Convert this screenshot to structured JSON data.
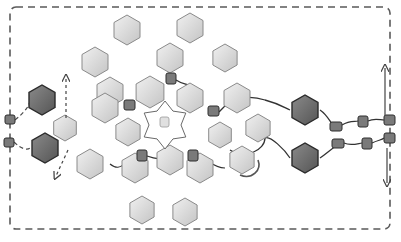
{
  "diagram": {
    "colors": {
      "background": "#ffffff",
      "light_hex_fill": "#d9d9d9",
      "light_hex_stroke": "#8a8a8a",
      "dark_hex_fill": "#6f6f6f",
      "dark_hex_stroke": "#2a2a2a",
      "linker_fill": "#7a7a7a",
      "line": "#4a4a4a",
      "dash": "#5a5a5a"
    },
    "boundary": {
      "x": 10,
      "y": 7,
      "w": 380,
      "h": 222
    },
    "light_hexagons": [
      {
        "cx": 127,
        "cy": 30,
        "r": 15
      },
      {
        "cx": 190,
        "cy": 28,
        "r": 15
      },
      {
        "cx": 95,
        "cy": 62,
        "r": 15
      },
      {
        "cx": 170,
        "cy": 58,
        "r": 15
      },
      {
        "cx": 225,
        "cy": 58,
        "r": 14
      },
      {
        "cx": 110,
        "cy": 92,
        "r": 15
      },
      {
        "cx": 150,
        "cy": 92,
        "r": 16
      },
      {
        "cx": 190,
        "cy": 98,
        "r": 15
      },
      {
        "cx": 237,
        "cy": 98,
        "r": 15
      },
      {
        "cx": 105,
        "cy": 108,
        "r": 15
      },
      {
        "cx": 128,
        "cy": 132,
        "r": 14
      },
      {
        "cx": 65,
        "cy": 128,
        "r": 13
      },
      {
        "cx": 220,
        "cy": 135,
        "r": 13
      },
      {
        "cx": 258,
        "cy": 128,
        "r": 14
      },
      {
        "cx": 90,
        "cy": 164,
        "r": 15
      },
      {
        "cx": 135,
        "cy": 168,
        "r": 15
      },
      {
        "cx": 170,
        "cy": 160,
        "r": 15
      },
      {
        "cx": 200,
        "cy": 168,
        "r": 15
      },
      {
        "cx": 242,
        "cy": 160,
        "r": 14
      },
      {
        "cx": 142,
        "cy": 210,
        "r": 14
      },
      {
        "cx": 185,
        "cy": 212,
        "r": 14
      }
    ],
    "dark_hexagons": [
      {
        "cx": 42,
        "cy": 100,
        "r": 15
      },
      {
        "cx": 45,
        "cy": 148,
        "r": 15
      },
      {
        "cx": 305,
        "cy": 110,
        "r": 15
      },
      {
        "cx": 305,
        "cy": 158,
        "r": 15
      }
    ],
    "linkers": [
      {
        "x": 5,
        "y": 115,
        "w": 10,
        "h": 9
      },
      {
        "x": 4,
        "y": 138,
        "w": 10,
        "h": 9
      },
      {
        "x": 166,
        "y": 73,
        "w": 10,
        "h": 11
      },
      {
        "x": 124,
        "y": 100,
        "w": 11,
        "h": 10
      },
      {
        "x": 208,
        "y": 106,
        "w": 11,
        "h": 10
      },
      {
        "x": 137,
        "y": 150,
        "w": 10,
        "h": 11
      },
      {
        "x": 188,
        "y": 150,
        "w": 10,
        "h": 11
      },
      {
        "x": 330,
        "y": 122,
        "w": 12,
        "h": 9
      },
      {
        "x": 332,
        "y": 139,
        "w": 12,
        "h": 9
      },
      {
        "x": 358,
        "y": 116,
        "w": 10,
        "h": 11
      },
      {
        "x": 362,
        "y": 138,
        "w": 10,
        "h": 11
      },
      {
        "x": 384,
        "y": 115,
        "w": 11,
        "h": 10
      },
      {
        "x": 384,
        "y": 133,
        "w": 11,
        "h": 10
      }
    ],
    "center_ring": {
      "cx": 165,
      "cy": 125,
      "r_outer": 24,
      "r_inner": 16,
      "points": 6
    },
    "arrows": [
      {
        "label": "left-up",
        "from": [
          66,
          118
        ],
        "to": [
          66,
          78
        ]
      },
      {
        "label": "left-down",
        "from": [
          68,
          150
        ],
        "to": [
          56,
          176
        ]
      },
      {
        "label": "right-up",
        "from": [
          385,
          115
        ],
        "to": [
          385,
          68
        ]
      },
      {
        "label": "right-down",
        "from": [
          387,
          148
        ],
        "to": [
          387,
          183
        ]
      }
    ]
  }
}
